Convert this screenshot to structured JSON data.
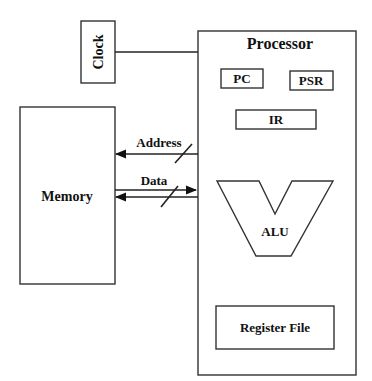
{
  "diagram": {
    "clock": {
      "label": "Clock"
    },
    "processor": {
      "label": "Processor",
      "pc": {
        "label": "PC"
      },
      "psr": {
        "label": "PSR"
      },
      "ir": {
        "label": "IR"
      },
      "alu": {
        "label": "ALU"
      },
      "register_file": {
        "label": "Register File"
      }
    },
    "memory": {
      "label": "Memory"
    },
    "buses": {
      "address": {
        "label": "Address",
        "direction": "processor-to-memory"
      },
      "data": {
        "label": "Data",
        "direction": "bidirectional"
      }
    },
    "colors": {
      "stroke": "#333333",
      "text": "#111111",
      "background": "#ffffff"
    }
  }
}
